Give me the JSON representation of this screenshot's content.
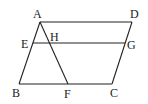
{
  "diagram": {
    "type": "geometry",
    "shape": "parallelogram ABCD with segments EG and AF",
    "points": {
      "A": {
        "label": "A",
        "x": 40,
        "y": 22
      },
      "D": {
        "label": "D",
        "x": 132,
        "y": 22
      },
      "E": {
        "label": "E",
        "x": 33,
        "y": 43
      },
      "H": {
        "label": "H",
        "x": 48,
        "y": 43
      },
      "G": {
        "label": "G",
        "x": 125,
        "y": 43
      },
      "B": {
        "label": "B",
        "x": 19,
        "y": 84
      },
      "F": {
        "label": "F",
        "x": 68,
        "y": 84
      },
      "C": {
        "label": "C",
        "x": 112,
        "y": 84
      }
    },
    "segments": [
      "AD",
      "DC",
      "CB",
      "BA",
      "EG",
      "AF"
    ]
  }
}
